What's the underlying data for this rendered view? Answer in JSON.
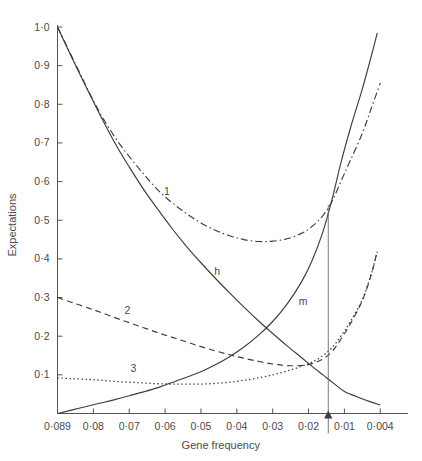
{
  "chart_data": {
    "type": "line",
    "title": "",
    "xlabel": "Gene frequency",
    "ylabel": "Expectations",
    "grid": false,
    "legend": "inline-labels",
    "x_axis_reversed": true,
    "x_tick_labels": [
      "0·089",
      "0·08",
      "0·07",
      "0·06",
      "0·05",
      "0·04",
      "0·03",
      "0·02",
      "0·01",
      "0·004"
    ],
    "x_tick_values": [
      0.089,
      0.08,
      0.07,
      0.06,
      0.05,
      0.04,
      0.03,
      0.02,
      0.01,
      0.004
    ],
    "y_tick_labels": [
      "1·0",
      "0·9",
      "0·8",
      "0·7",
      "0·6",
      "0·5",
      "0·4",
      "0·3",
      "0·2",
      "0·1"
    ],
    "y_tick_values": [
      1.0,
      0.9,
      0.8,
      0.7,
      0.6,
      0.5,
      0.4,
      0.3,
      0.2,
      0.1
    ],
    "ylim": [
      0,
      1.0
    ],
    "annotations": [
      {
        "name": "marker-arrow",
        "x_value": 0.0145,
        "label": ""
      }
    ],
    "series": [
      {
        "name": "1",
        "label": "1",
        "style": "dash-dot",
        "label_x_value": 0.0595,
        "label_y_value": 0.565,
        "points": [
          [
            0.089,
            1.0
          ],
          [
            0.085,
            0.915
          ],
          [
            0.081,
            0.83
          ],
          [
            0.078,
            0.775
          ],
          [
            0.074,
            0.715
          ],
          [
            0.07,
            0.665
          ],
          [
            0.066,
            0.62
          ],
          [
            0.062,
            0.578
          ],
          [
            0.058,
            0.545
          ],
          [
            0.054,
            0.517
          ],
          [
            0.05,
            0.493
          ],
          [
            0.046,
            0.474
          ],
          [
            0.042,
            0.46
          ],
          [
            0.038,
            0.45
          ],
          [
            0.034,
            0.445
          ],
          [
            0.03,
            0.446
          ],
          [
            0.026,
            0.452
          ],
          [
            0.022,
            0.466
          ],
          [
            0.019,
            0.484
          ],
          [
            0.016,
            0.512
          ],
          [
            0.0135,
            0.548
          ],
          [
            0.011,
            0.6
          ],
          [
            0.009,
            0.655
          ],
          [
            0.007,
            0.725
          ],
          [
            0.0055,
            0.79
          ],
          [
            0.004,
            0.855
          ]
        ]
      },
      {
        "name": "h",
        "label": "h",
        "style": "solid",
        "label_x_value": 0.0455,
        "label_y_value": 0.358,
        "points": [
          [
            0.089,
            1.0
          ],
          [
            0.085,
            0.912
          ],
          [
            0.081,
            0.828
          ],
          [
            0.078,
            0.77
          ],
          [
            0.074,
            0.7
          ],
          [
            0.07,
            0.638
          ],
          [
            0.066,
            0.58
          ],
          [
            0.062,
            0.528
          ],
          [
            0.058,
            0.478
          ],
          [
            0.054,
            0.432
          ],
          [
            0.05,
            0.39
          ],
          [
            0.046,
            0.35
          ],
          [
            0.042,
            0.312
          ],
          [
            0.038,
            0.275
          ],
          [
            0.034,
            0.24
          ],
          [
            0.03,
            0.207
          ],
          [
            0.026,
            0.175
          ],
          [
            0.022,
            0.145
          ],
          [
            0.019,
            0.122
          ],
          [
            0.016,
            0.1
          ],
          [
            0.013,
            0.078
          ],
          [
            0.01,
            0.057
          ],
          [
            0.008,
            0.044
          ],
          [
            0.006,
            0.032
          ],
          [
            0.004,
            0.022
          ]
        ]
      },
      {
        "name": "m",
        "label": "m",
        "style": "solid",
        "label_x_value": 0.0215,
        "label_y_value": 0.28,
        "points": [
          [
            0.089,
            0.0
          ],
          [
            0.085,
            0.01
          ],
          [
            0.081,
            0.02
          ],
          [
            0.078,
            0.027
          ],
          [
            0.074,
            0.036
          ],
          [
            0.07,
            0.046
          ],
          [
            0.066,
            0.056
          ],
          [
            0.062,
            0.067
          ],
          [
            0.058,
            0.08
          ],
          [
            0.054,
            0.094
          ],
          [
            0.05,
            0.108
          ],
          [
            0.046,
            0.126
          ],
          [
            0.042,
            0.147
          ],
          [
            0.038,
            0.172
          ],
          [
            0.034,
            0.202
          ],
          [
            0.03,
            0.238
          ],
          [
            0.026,
            0.283
          ],
          [
            0.022,
            0.34
          ],
          [
            0.019,
            0.396
          ],
          [
            0.016,
            0.47
          ],
          [
            0.0135,
            0.552
          ],
          [
            0.011,
            0.648
          ],
          [
            0.009,
            0.738
          ],
          [
            0.007,
            0.84
          ],
          [
            0.0055,
            0.925
          ],
          [
            0.0045,
            0.985
          ]
        ]
      },
      {
        "name": "2",
        "label": "2",
        "style": "dashed",
        "label_x_value": 0.0705,
        "label_y_value": 0.258,
        "points": [
          [
            0.089,
            0.3
          ],
          [
            0.085,
            0.286
          ],
          [
            0.081,
            0.272
          ],
          [
            0.078,
            0.262
          ],
          [
            0.074,
            0.248
          ],
          [
            0.07,
            0.235
          ],
          [
            0.066,
            0.222
          ],
          [
            0.062,
            0.209
          ],
          [
            0.058,
            0.197
          ],
          [
            0.054,
            0.185
          ],
          [
            0.05,
            0.173
          ],
          [
            0.046,
            0.162
          ],
          [
            0.042,
            0.152
          ],
          [
            0.038,
            0.143
          ],
          [
            0.034,
            0.135
          ],
          [
            0.03,
            0.128
          ],
          [
            0.026,
            0.124
          ],
          [
            0.022,
            0.124
          ],
          [
            0.019,
            0.129
          ],
          [
            0.016,
            0.141
          ],
          [
            0.0135,
            0.16
          ],
          [
            0.011,
            0.192
          ],
          [
            0.009,
            0.232
          ],
          [
            0.007,
            0.292
          ],
          [
            0.0055,
            0.36
          ],
          [
            0.0045,
            0.42
          ]
        ]
      },
      {
        "name": "3",
        "label": "3",
        "style": "dotted",
        "label_x_value": 0.0688,
        "label_y_value": 0.108,
        "points": [
          [
            0.089,
            0.092
          ],
          [
            0.085,
            0.09
          ],
          [
            0.081,
            0.088
          ],
          [
            0.078,
            0.086
          ],
          [
            0.074,
            0.083
          ],
          [
            0.07,
            0.081
          ],
          [
            0.066,
            0.079
          ],
          [
            0.062,
            0.077
          ],
          [
            0.058,
            0.076
          ],
          [
            0.054,
            0.076
          ],
          [
            0.05,
            0.076
          ],
          [
            0.046,
            0.078
          ],
          [
            0.042,
            0.081
          ],
          [
            0.038,
            0.086
          ],
          [
            0.034,
            0.092
          ],
          [
            0.03,
            0.1
          ],
          [
            0.026,
            0.11
          ],
          [
            0.022,
            0.122
          ],
          [
            0.019,
            0.133
          ],
          [
            0.016,
            0.15
          ],
          [
            0.0135,
            0.17
          ],
          [
            0.011,
            0.2
          ],
          [
            0.009,
            0.238
          ],
          [
            0.007,
            0.295
          ],
          [
            0.0055,
            0.362
          ],
          [
            0.0045,
            0.42
          ]
        ]
      }
    ]
  }
}
